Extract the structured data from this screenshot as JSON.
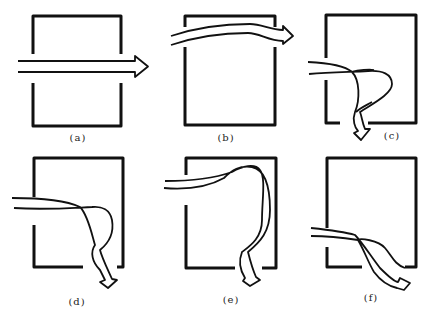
{
  "figure": {
    "panels": [
      {
        "id": "a",
        "label": "(a)",
        "description": "Airflow passes straight through room via aligned openings on both walls"
      },
      {
        "id": "b",
        "label": "(b)",
        "description": "Airflow passes along top of room through high openings"
      },
      {
        "id": "c",
        "label": "(c)",
        "description": "Airflow enters left opening, loops, and exits through bottom opening"
      },
      {
        "id": "d",
        "label": "(d)",
        "description": "Airflow enters left opening, loops, exits bottom-right opening"
      },
      {
        "id": "e",
        "label": "(e)",
        "description": "Airflow enters high left opening, sweeps right wall, exits bottom opening"
      },
      {
        "id": "f",
        "label": "(f)",
        "description": "Airflow enters low left opening, flows diagonally to bottom-right opening"
      }
    ],
    "colors": {
      "stroke": "#111111",
      "background": "#ffffff"
    }
  }
}
